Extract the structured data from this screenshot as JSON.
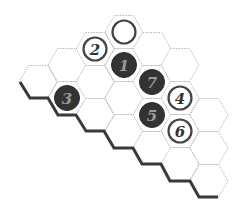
{
  "puzzle": {
    "type": "hex-number-path",
    "colors": {
      "cell_border": "#b8b8b8",
      "shadow": "#3a3a3a",
      "dark_disc": "#333333",
      "dark_disc_number": "#9a9a9a",
      "light_disc_ring": "#444444",
      "light_disc_number": "#333333"
    },
    "cells": [
      {
        "col": 0,
        "x": 38,
        "y": 82
      },
      {
        "col": 1,
        "x": 67,
        "y": 65
      },
      {
        "col": 1,
        "x": 67,
        "y": 98
      },
      {
        "col": 2,
        "x": 95,
        "y": 49
      },
      {
        "col": 2,
        "x": 95,
        "y": 82
      },
      {
        "col": 2,
        "x": 95,
        "y": 115
      },
      {
        "col": 3,
        "x": 124,
        "y": 32
      },
      {
        "col": 3,
        "x": 124,
        "y": 65
      },
      {
        "col": 3,
        "x": 124,
        "y": 98
      },
      {
        "col": 3,
        "x": 124,
        "y": 131
      },
      {
        "col": 4,
        "x": 152,
        "y": 49
      },
      {
        "col": 4,
        "x": 152,
        "y": 82
      },
      {
        "col": 4,
        "x": 152,
        "y": 115
      },
      {
        "col": 4,
        "x": 152,
        "y": 148
      },
      {
        "col": 5,
        "x": 180,
        "y": 65
      },
      {
        "col": 5,
        "x": 180,
        "y": 98
      },
      {
        "col": 5,
        "x": 180,
        "y": 131
      },
      {
        "col": 5,
        "x": 180,
        "y": 164
      },
      {
        "col": 6,
        "x": 209,
        "y": 115
      },
      {
        "col": 6,
        "x": 209,
        "y": 148
      },
      {
        "col": 6,
        "x": 209,
        "y": 181
      }
    ],
    "discs": [
      {
        "label": "",
        "style": "light",
        "x": 124,
        "y": 32
      },
      {
        "label": "2",
        "style": "light",
        "x": 95,
        "y": 49
      },
      {
        "label": "1",
        "style": "dark",
        "x": 124,
        "y": 65
      },
      {
        "label": "7",
        "style": "dark",
        "x": 152,
        "y": 82
      },
      {
        "label": "3",
        "style": "dark",
        "x": 67,
        "y": 98
      },
      {
        "label": "4",
        "style": "light",
        "x": 180,
        "y": 98
      },
      {
        "label": "5",
        "style": "dark",
        "x": 152,
        "y": 115
      },
      {
        "label": "6",
        "style": "light",
        "x": 180,
        "y": 131
      }
    ]
  }
}
